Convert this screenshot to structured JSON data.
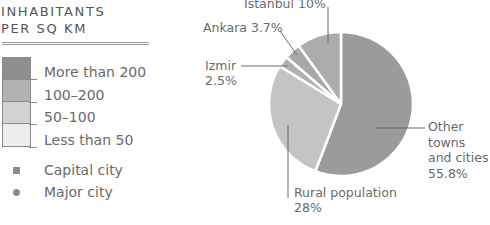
{
  "legend": {
    "title_lines": [
      "INHABITANTS",
      "PER SQ KM"
    ],
    "density_classes": [
      {
        "label": "More than 200",
        "color": "#8e8e8e"
      },
      {
        "label": "100–200",
        "color": "#b2b2b2"
      },
      {
        "label": "50–100",
        "color": "#d2d2d2"
      },
      {
        "label": "Less than 50",
        "color": "#ededed"
      }
    ],
    "symbols": [
      {
        "label": "Capital city",
        "shape": "square"
      },
      {
        "label": "Major city",
        "shape": "circle"
      }
    ]
  },
  "chart_data": {
    "type": "pie",
    "title": "",
    "start": "top",
    "direction": "clockwise",
    "slices": [
      {
        "name": "Other towns and cities",
        "value": 55.8,
        "label_lines": [
          "Other",
          "towns",
          "and cities",
          "55.8%"
        ],
        "color": "#9b9b9b"
      },
      {
        "name": "Rural population",
        "value": 28,
        "label_lines": [
          "Rural population",
          "28%"
        ],
        "color": "#c4c4c4"
      },
      {
        "name": "Izmir",
        "value": 2.5,
        "label_lines": [
          "Izmir",
          "2.5%"
        ],
        "color": "#b0b0b0"
      },
      {
        "name": "Ankara",
        "value": 3.7,
        "label_lines": [
          "Ankara 3.7%"
        ],
        "color": "#a8a8a8"
      },
      {
        "name": "Istanbul",
        "value": 10,
        "label_lines": [
          "Istanbul 10%"
        ],
        "color": "#acacac"
      }
    ]
  }
}
